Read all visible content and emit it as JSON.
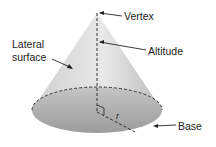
{
  "diagram": {
    "labels": {
      "vertex": "Vertex",
      "altitude": "Altitude",
      "lateral_line1": "Lateral",
      "lateral_line2": "surface",
      "base": "Base",
      "radius": "r"
    },
    "colors": {
      "fill_light": "#e6e6e6",
      "fill_dark": "#a8a8a8",
      "line": "#222222"
    }
  }
}
